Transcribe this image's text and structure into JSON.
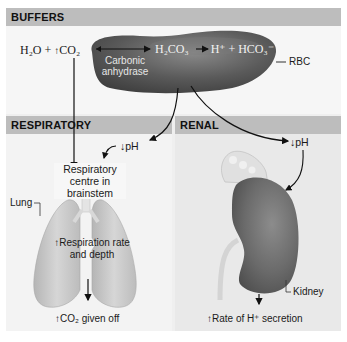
{
  "sections": {
    "buffers": {
      "title": "BUFFERS",
      "equation": {
        "reactant_water": "H₂O",
        "plus": "+",
        "increase_arrow": "↑",
        "reactant_co2": "CO₂",
        "intermediate": "H₂CO₃",
        "product_h": "H⁺",
        "product_plus": "+",
        "product_bicarb": "HCO₃⁻"
      },
      "enzyme_label_line1": "Carbonic",
      "enzyme_label_line2": "anhydrase",
      "cell_label": "RBC"
    },
    "respiratory": {
      "title": "RESPIRATORY",
      "ph_indicator": "↓pH",
      "centre_line1": "Respiratory",
      "centre_line2": "centre in",
      "centre_line3": "brainstem",
      "organ_label": "Lung",
      "effect_line1": "↑Respiration rate",
      "effect_line2": "and depth",
      "outcome": "↑CO₂ given off"
    },
    "renal": {
      "title": "RENAL",
      "ph_indicator": "↓pH",
      "organ_label": "Kidney",
      "outcome": "↑Rate of H⁺ secretion"
    }
  },
  "colors": {
    "band": "#bdbdbd",
    "panel_bg": "#efefef",
    "rbc": "#5a5a5a",
    "lung": "#c9c9c9",
    "kidney": "#6e6e6e",
    "arrow": "#111111"
  }
}
